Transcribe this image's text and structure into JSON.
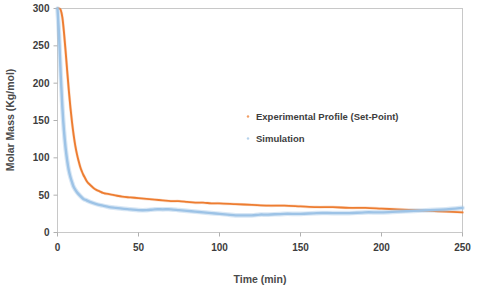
{
  "chart_data": {
    "type": "line",
    "title": "",
    "xlabel": "Time (min)",
    "ylabel": "Molar Mass (Kg/mol)",
    "xlim": [
      0,
      250
    ],
    "ylim": [
      0,
      300
    ],
    "xticks": [
      0,
      50,
      100,
      150,
      200,
      250
    ],
    "yticks": [
      0,
      50,
      100,
      150,
      200,
      250,
      300
    ],
    "grid": false,
    "legend_position": "upper-center-right",
    "colors": {
      "experimental": "#ED7D31",
      "simulation": "#9DC3E6",
      "axis": "#c8c8c8",
      "text": "#3d3d3d"
    },
    "series": [
      {
        "name": "Experimental Profile (Set-Point)",
        "color": "#ED7D31",
        "style": "solid",
        "x": [
          0,
          1,
          2,
          3,
          4,
          5,
          6,
          7,
          8,
          9,
          10,
          11,
          12,
          13,
          14,
          15,
          16,
          17,
          18,
          19,
          20,
          22,
          24,
          26,
          28,
          30,
          35,
          40,
          45,
          50,
          55,
          60,
          65,
          70,
          75,
          80,
          85,
          90,
          95,
          100,
          110,
          120,
          130,
          140,
          150,
          160,
          170,
          180,
          190,
          200,
          210,
          220,
          230,
          240,
          250
        ],
        "y": [
          300,
          300,
          298,
          288,
          268,
          243,
          216,
          190,
          167,
          147,
          130,
          116,
          105,
          96,
          88,
          82,
          77,
          73,
          69,
          66,
          64,
          60,
          57,
          55,
          53,
          52,
          50,
          48,
          47,
          46,
          45,
          44,
          43,
          42,
          42,
          41,
          40,
          40,
          39,
          39,
          38,
          37,
          36,
          36,
          35,
          34,
          34,
          33,
          33,
          32,
          31,
          30,
          29,
          28,
          27
        ]
      },
      {
        "name": "Simulation",
        "color": "#9DC3E6",
        "style": "dotted",
        "x": [
          0,
          1,
          2,
          3,
          4,
          5,
          6,
          7,
          8,
          9,
          10,
          12,
          14,
          16,
          18,
          20,
          24,
          28,
          32,
          36,
          40,
          45,
          50,
          55,
          60,
          65,
          70,
          75,
          80,
          85,
          90,
          95,
          100,
          105,
          110,
          115,
          120,
          125,
          130,
          140,
          150,
          160,
          170,
          180,
          190,
          200,
          210,
          220,
          230,
          240,
          250
        ],
        "y": [
          300,
          262,
          210,
          168,
          136,
          113,
          96,
          83,
          74,
          67,
          61,
          54,
          49,
          45,
          43,
          41,
          38,
          36,
          34,
          33,
          32,
          31,
          30,
          30,
          31,
          31,
          31,
          30,
          29,
          28,
          27,
          26,
          25,
          24,
          23,
          23,
          23,
          24,
          24,
          25,
          25,
          26,
          26,
          26,
          27,
          27,
          28,
          29,
          30,
          31,
          33
        ]
      }
    ]
  },
  "legend": {
    "entries": [
      {
        "label": "Experimental Profile (Set-Point)",
        "marker": "dot-marker",
        "color": "#ED7D31"
      },
      {
        "label": "Simulation",
        "marker": "dot-marker",
        "color": "#9DC3E6"
      }
    ]
  },
  "axes": {
    "x_tick_labels": [
      "0",
      "50",
      "100",
      "150",
      "200",
      "250"
    ],
    "y_tick_labels": [
      "0",
      "50",
      "100",
      "150",
      "200",
      "250",
      "300"
    ],
    "x_title": "Time (min)",
    "y_title": "Molar Mass (Kg/mol)"
  }
}
